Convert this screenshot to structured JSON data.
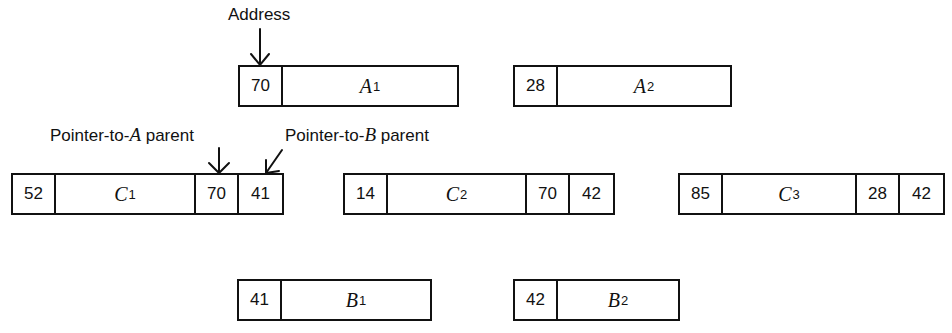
{
  "labels": {
    "address": "Address",
    "pointer_a_prefix": "Pointer-to-",
    "pointer_a_var": "A",
    "pointer_a_suffix": " parent",
    "pointer_b_prefix": "Pointer-to-",
    "pointer_b_var": "B",
    "pointer_b_suffix": " parent"
  },
  "records": {
    "A1": {
      "address": "70",
      "name": "A",
      "sub": "1"
    },
    "A2": {
      "address": "28",
      "name": "A",
      "sub": "2"
    },
    "C1": {
      "address": "52",
      "name": "C",
      "sub": "1",
      "ptr_a": "70",
      "ptr_b": "41"
    },
    "C2": {
      "address": "14",
      "name": "C",
      "sub": "2",
      "ptr_a": "70",
      "ptr_b": "42"
    },
    "C3": {
      "address": "85",
      "name": "C",
      "sub": "3",
      "ptr_a": "28",
      "ptr_b": "42"
    },
    "B1": {
      "address": "41",
      "name": "B",
      "sub": "1"
    },
    "B2": {
      "address": "42",
      "name": "B",
      "sub": "2"
    }
  }
}
